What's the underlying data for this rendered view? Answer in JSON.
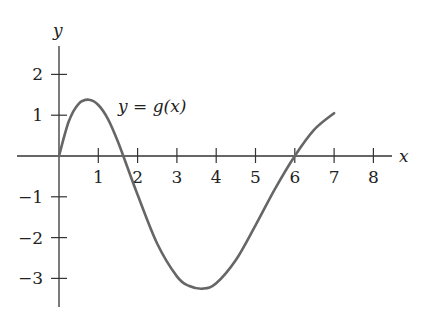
{
  "chart_data": {
    "type": "line",
    "title": "",
    "xlabel": "x",
    "ylabel": "y",
    "curve_label": "y = g(x)",
    "xlim": [
      0,
      8.6
    ],
    "ylim": [
      -3.7,
      2.7
    ],
    "xticks": [
      1,
      2,
      3,
      4,
      5,
      6,
      7,
      8
    ],
    "xtick_labels": [
      "1",
      "2",
      "3",
      "4",
      "5",
      "6",
      "7",
      "8"
    ],
    "yticks": [
      2,
      1,
      -1,
      -2,
      -3
    ],
    "ytick_labels": [
      "2",
      "1",
      "−1",
      "−2",
      "−3"
    ],
    "grid": false,
    "legend": "none",
    "series": [
      {
        "name": "g(x)",
        "color": "#666666",
        "x": [
          0,
          0.25,
          0.5,
          0.76,
          1.0,
          1.25,
          1.5,
          1.75,
          2.0,
          2.5,
          3.0,
          3.3,
          3.67,
          4.0,
          4.5,
          5.0,
          5.5,
          6.0,
          6.5,
          7.0
        ],
        "y": [
          0,
          0.85,
          1.28,
          1.38,
          1.25,
          0.9,
          0.35,
          -0.3,
          -0.95,
          -2.15,
          -2.95,
          -3.18,
          -3.25,
          -3.12,
          -2.55,
          -1.7,
          -0.8,
          0.0,
          0.65,
          1.05
        ]
      }
    ],
    "annotations": [
      {
        "text": "y = g(x)",
        "x": 1.5,
        "y": 1.0
      }
    ],
    "key_points": {
      "zeros": [
        0,
        1.65,
        6.0
      ],
      "local_max": {
        "x": 0.76,
        "y": 1.38
      },
      "local_min": {
        "x": 3.67,
        "y": -3.25
      },
      "endpoint": {
        "x": 7.0,
        "y": 1.05
      }
    }
  }
}
